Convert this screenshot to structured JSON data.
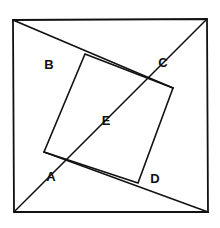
{
  "figure": {
    "canvas": {
      "width": 220,
      "height": 228
    },
    "stroke_color": "#111111",
    "fill_color": "#ffffff",
    "background_color": "#ffffff",
    "outer_square": {
      "name": "outer-square",
      "stroke_width": 1.8,
      "points": "13,20 207,19 208,212 14,212"
    },
    "inner_square": {
      "name": "inner-square",
      "stroke_width": 1.6,
      "points": "85,54 173,88 138,183 44,152"
    },
    "cut_lines": [
      {
        "name": "cut-line-top-left-to-inner-right",
        "x1": 13,
        "y1": 20,
        "x2": 173,
        "y2": 88
      },
      {
        "name": "cut-line-top-right-to-bottom-left",
        "x1": 207,
        "y1": 19,
        "x2": 14,
        "y2": 212
      },
      {
        "name": "cut-line-inner-left-to-bottom-right",
        "x1": 44,
        "y1": 152,
        "x2": 208,
        "y2": 212
      }
    ],
    "labels": [
      {
        "id": "A",
        "text": "A",
        "x": 51,
        "y": 176
      },
      {
        "id": "B",
        "text": "B",
        "x": 49,
        "y": 64
      },
      {
        "id": "C",
        "text": "C",
        "x": 163,
        "y": 62
      },
      {
        "id": "D",
        "text": "D",
        "x": 155,
        "y": 178
      },
      {
        "id": "E",
        "text": "E",
        "x": 106,
        "y": 120
      }
    ]
  }
}
